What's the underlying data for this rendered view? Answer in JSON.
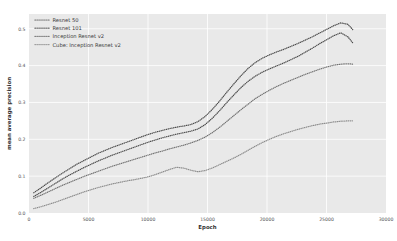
{
  "chart_data": {
    "type": "line",
    "title": "",
    "xlabel": "Epoch",
    "ylabel": "mean average precision",
    "xlim": [
      0,
      30000
    ],
    "ylim": [
      0.0,
      0.54
    ],
    "grid": true,
    "legend_position": "upper-left",
    "line_style": "dotted",
    "xticks": [
      0,
      5000,
      10000,
      15000,
      20000,
      25000,
      30000
    ],
    "xtick_labels": [
      "0",
      "5000",
      "10000",
      "15000",
      "20000",
      "25000",
      "30000"
    ],
    "yticks": [
      0.0,
      0.1,
      0.2,
      0.3,
      0.4,
      0.5
    ],
    "ytick_labels": [
      "0.0",
      "0.1",
      "0.2",
      "0.3",
      "0.4",
      "0.5"
    ],
    "series": [
      {
        "name": "Resnet 50",
        "color": "#4d4d4d",
        "x": [
          400,
          1000,
          1600,
          2200,
          2800,
          3400,
          4000,
          4600,
          5200,
          5800,
          6400,
          7000,
          7600,
          8200,
          8800,
          9400,
          10000,
          10600,
          11200,
          11800,
          12400,
          13000,
          13600,
          14200,
          14800,
          15400,
          16000,
          16600,
          17200,
          17800,
          18400,
          19000,
          19600,
          20200,
          20800,
          21400,
          22000,
          22600,
          23200,
          23800,
          24400,
          25000,
          25600,
          26200,
          26800,
          27200
        ],
        "values": [
          0.055,
          0.068,
          0.082,
          0.095,
          0.108,
          0.12,
          0.132,
          0.142,
          0.152,
          0.162,
          0.17,
          0.178,
          0.185,
          0.192,
          0.199,
          0.206,
          0.213,
          0.219,
          0.224,
          0.229,
          0.233,
          0.236,
          0.24,
          0.248,
          0.262,
          0.281,
          0.303,
          0.327,
          0.35,
          0.372,
          0.392,
          0.408,
          0.42,
          0.429,
          0.437,
          0.444,
          0.452,
          0.46,
          0.469,
          0.478,
          0.488,
          0.498,
          0.508,
          0.516,
          0.512,
          0.498
        ]
      },
      {
        "name": "Resnet 101",
        "color": "#4d4d4d",
        "x": [
          400,
          1000,
          1600,
          2200,
          2800,
          3400,
          4000,
          4600,
          5200,
          5800,
          6400,
          7000,
          7600,
          8200,
          8800,
          9400,
          10000,
          10600,
          11200,
          11800,
          12400,
          13000,
          13600,
          14200,
          14800,
          15400,
          16000,
          16600,
          17200,
          17800,
          18400,
          19000,
          19600,
          20200,
          20800,
          21400,
          22000,
          22600,
          23200,
          23800,
          24400,
          25000,
          25600,
          26200,
          26800,
          27200
        ],
        "values": [
          0.045,
          0.056,
          0.068,
          0.08,
          0.092,
          0.103,
          0.113,
          0.123,
          0.132,
          0.141,
          0.149,
          0.157,
          0.164,
          0.171,
          0.178,
          0.185,
          0.192,
          0.198,
          0.204,
          0.209,
          0.214,
          0.218,
          0.222,
          0.228,
          0.24,
          0.257,
          0.277,
          0.299,
          0.32,
          0.34,
          0.357,
          0.371,
          0.382,
          0.391,
          0.399,
          0.407,
          0.416,
          0.425,
          0.436,
          0.447,
          0.459,
          0.47,
          0.481,
          0.489,
          0.478,
          0.462
        ]
      },
      {
        "name": "Inception Resnet v2",
        "color": "#737373",
        "x": [
          400,
          1000,
          1600,
          2200,
          2800,
          3400,
          4000,
          4600,
          5200,
          5800,
          6400,
          7000,
          7600,
          8200,
          8800,
          9400,
          10000,
          10600,
          11200,
          11800,
          12400,
          13000,
          13600,
          14200,
          14800,
          15400,
          16000,
          16600,
          17200,
          17800,
          18400,
          19000,
          19600,
          20200,
          20800,
          21400,
          22000,
          22600,
          23200,
          23800,
          24400,
          25000,
          25600,
          26200,
          26800,
          27200
        ],
        "values": [
          0.04,
          0.048,
          0.057,
          0.066,
          0.075,
          0.083,
          0.091,
          0.099,
          0.106,
          0.113,
          0.12,
          0.127,
          0.133,
          0.139,
          0.145,
          0.151,
          0.157,
          0.163,
          0.168,
          0.174,
          0.179,
          0.184,
          0.19,
          0.197,
          0.206,
          0.218,
          0.232,
          0.248,
          0.264,
          0.28,
          0.295,
          0.31,
          0.322,
          0.333,
          0.343,
          0.352,
          0.36,
          0.368,
          0.376,
          0.383,
          0.39,
          0.396,
          0.401,
          0.404,
          0.405,
          0.404
        ]
      },
      {
        "name": "Cube: Inception Resnet v2",
        "color": "#8c8c8c",
        "x": [
          400,
          1000,
          1600,
          2200,
          2800,
          3400,
          4000,
          4600,
          5200,
          5800,
          6400,
          7000,
          7600,
          8200,
          8800,
          9400,
          10000,
          10600,
          11200,
          11800,
          12400,
          13000,
          13600,
          14200,
          14800,
          15400,
          16000,
          16600,
          17200,
          17800,
          18400,
          19000,
          19600,
          20200,
          20800,
          21400,
          22000,
          22600,
          23200,
          23800,
          24400,
          25000,
          25600,
          26200,
          26800,
          27200
        ],
        "values": [
          0.012,
          0.017,
          0.023,
          0.029,
          0.036,
          0.043,
          0.05,
          0.057,
          0.063,
          0.069,
          0.074,
          0.079,
          0.083,
          0.087,
          0.09,
          0.094,
          0.098,
          0.104,
          0.111,
          0.118,
          0.124,
          0.122,
          0.116,
          0.112,
          0.115,
          0.122,
          0.131,
          0.14,
          0.149,
          0.159,
          0.17,
          0.181,
          0.191,
          0.2,
          0.208,
          0.215,
          0.221,
          0.227,
          0.232,
          0.237,
          0.241,
          0.244,
          0.247,
          0.249,
          0.25,
          0.25
        ]
      }
    ]
  },
  "legend": {
    "items": [
      {
        "label": "Resnet 50"
      },
      {
        "label": "Resnet 101"
      },
      {
        "label": "Inception Resnet v2"
      },
      {
        "label": "Cube: Inception Resnet v2"
      }
    ]
  }
}
